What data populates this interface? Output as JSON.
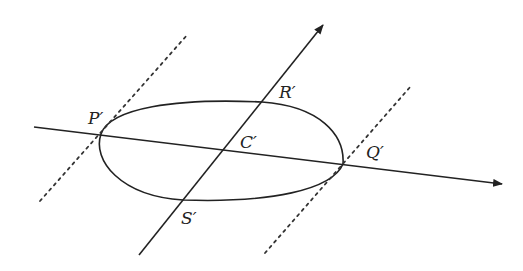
{
  "figure": {
    "colors": {
      "stroke": "#222222",
      "background": "#ffffff"
    },
    "labels": {
      "P": "P′",
      "Q": "Q′",
      "R": "R′",
      "S": "S′",
      "C": "C′"
    },
    "points": {
      "P": [
        101,
        134
      ],
      "Q": [
        343,
        164
      ],
      "R": [
        262,
        102
      ],
      "S": [
        183,
        200
      ],
      "C": [
        224,
        151
      ]
    },
    "axes": {
      "horizontal": {
        "from": [
          34,
          127
        ],
        "to": [
          502,
          184
        ],
        "arrow": true
      },
      "oblique": {
        "from": [
          139,
          255
        ],
        "to": [
          323,
          25
        ],
        "arrow": true
      }
    },
    "tangent_lines": [
      {
        "name": "tangent-at-P",
        "from": [
          40,
          201
        ],
        "to": [
          188,
          34
        ],
        "style": "dotted"
      },
      {
        "name": "tangent-at-Q",
        "from": [
          265,
          253
        ],
        "to": [
          411,
          86
        ],
        "style": "dotted"
      }
    ]
  }
}
